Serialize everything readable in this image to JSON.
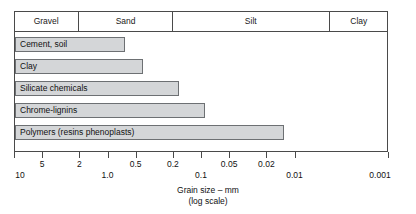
{
  "chart_data": {
    "type": "bar",
    "title": "",
    "orientation": "horizontal",
    "xlabel": "Grain size – mm",
    "xlabel_sub": "(log scale)",
    "ylabel": "",
    "scale": "log",
    "xlim": [
      10,
      0.001
    ],
    "x_axis_reversed": true,
    "grid": false,
    "legend": false,
    "categories": [
      "Cement, soil",
      "Clay",
      "Silicate chemicals",
      "Chrome-lignins",
      "Polymers (resins phenoplasts)"
    ],
    "values": [
      0.65,
      0.42,
      0.17,
      0.09,
      0.013
    ],
    "value_units": "mm",
    "value_note": "grain size at which each grouting material ceases to be applicable (bar extends from 10 mm down to the listed value)",
    "series": [
      {
        "name": "Applicable grain-size range",
        "values": [
          0.65,
          0.42,
          0.17,
          0.09,
          0.013
        ]
      }
    ],
    "tick_values": [
      10,
      5,
      2,
      1.0,
      0.5,
      0.2,
      0.1,
      0.05,
      0.02,
      0.01,
      0.001
    ],
    "tick_labels": [
      "10",
      "5",
      "2",
      "1.0",
      "0.5",
      "0.2",
      "0.1",
      "0.05",
      "0.02",
      "0.01",
      "0.001"
    ],
    "tick_label_row": [
      "b",
      "a",
      "a",
      "b",
      "a",
      "a",
      "b",
      "a",
      "a",
      "b",
      "b"
    ],
    "soil_classes": [
      {
        "label": "Gravel",
        "from": 10,
        "to": 2.0
      },
      {
        "label": "Sand",
        "from": 2.0,
        "to": 0.2
      },
      {
        "label": "Silt",
        "from": 0.2,
        "to": 0.0042
      },
      {
        "label": "Clay",
        "from": 0.0042,
        "to": 0.001
      }
    ],
    "colors": {
      "bar_fill": "#d4d6d8",
      "bar_border": "#6d7073",
      "frame": "#4a4a4a",
      "text": "#111111",
      "background": "#ffffff"
    }
  },
  "axis": {
    "caption_line1": "Grain size – mm",
    "caption_line2": "(log scale)"
  }
}
